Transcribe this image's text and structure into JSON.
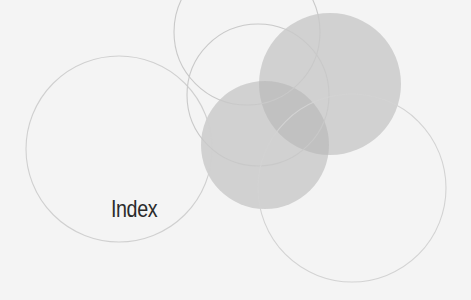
{
  "page": {
    "title": "Index",
    "background_color": "#f4f4f4",
    "text_color": "#2b2b2b"
  },
  "decoration": {
    "filled_circles": [
      {
        "cx": 330,
        "cy": 84,
        "r": 71,
        "fill": "#b4b4b4",
        "opacity": 0.55
      },
      {
        "cx": 265,
        "cy": 145,
        "r": 64,
        "fill": "#b4b4b4",
        "opacity": 0.55
      }
    ],
    "outline_circles": [
      {
        "cx": 119,
        "cy": 149,
        "r": 93,
        "stroke": "#d0d0d0"
      },
      {
        "cx": 247,
        "cy": 32,
        "r": 73,
        "stroke": "#cfcfcf"
      },
      {
        "cx": 258,
        "cy": 95,
        "r": 71,
        "stroke": "#cfcfcf"
      },
      {
        "cx": 352,
        "cy": 188,
        "r": 94,
        "stroke": "#d3d3d3"
      }
    ]
  }
}
